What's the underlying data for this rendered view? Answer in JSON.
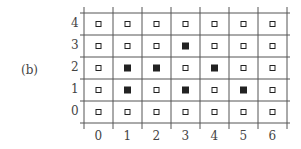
{
  "panel_label": "(b)",
  "grid": {
    "columns": [
      "0",
      "1",
      "2",
      "3",
      "4",
      "5",
      "6"
    ],
    "rows": [
      "0",
      "1",
      "2",
      "3",
      "4"
    ],
    "filled_cells": [
      {
        "col": 1,
        "row": 1
      },
      {
        "col": 1,
        "row": 2
      },
      {
        "col": 2,
        "row": 2
      },
      {
        "col": 3,
        "row": 1
      },
      {
        "col": 3,
        "row": 3
      },
      {
        "col": 4,
        "row": 2
      },
      {
        "col": 5,
        "row": 1
      }
    ],
    "empty_marker": "open-square",
    "filled_marker": "filled-square",
    "line_color": "#555555",
    "marker_color": "#222222"
  }
}
